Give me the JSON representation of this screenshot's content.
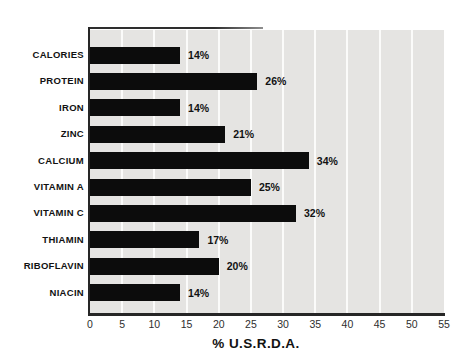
{
  "chart_data": {
    "type": "bar",
    "orientation": "horizontal",
    "title": "",
    "xlabel": "% U.S.R.D.A.",
    "ylabel": "",
    "xlim": [
      0,
      55
    ],
    "xticks": [
      0,
      5,
      10,
      15,
      20,
      25,
      30,
      35,
      40,
      45,
      50,
      55
    ],
    "grid": "vertical white gridlines on light gray plot background",
    "legend": "none",
    "categories": [
      "CALORIES",
      "PROTEIN",
      "IRON",
      "ZINC",
      "CALCIUM",
      "VITAMIN A",
      "VITAMIN C",
      "THIAMIN",
      "RIBOFLAVIN",
      "NIACIN"
    ],
    "values": [
      14,
      26,
      14,
      21,
      34,
      25,
      32,
      17,
      20,
      14
    ],
    "value_labels": [
      "14%",
      "26%",
      "14%",
      "21%",
      "34%",
      "25%",
      "32%",
      "17%",
      "20%",
      "14%"
    ],
    "colors": {
      "bar": "#0c0c0c",
      "plot_background": "#e5e4e2",
      "gridline": "#fbfbfa",
      "axis_line": "#262626",
      "text": "#121212"
    }
  }
}
